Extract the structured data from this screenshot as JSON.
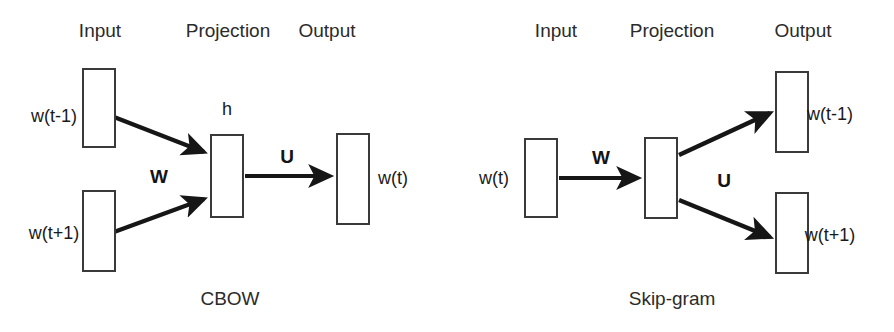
{
  "figure": {
    "width": 894,
    "height": 332,
    "background": "#ffffff",
    "stroke_color": "#222222",
    "box_border_color": "#3a3a3a",
    "text_color": "#1a1a1a"
  },
  "diagrams": [
    {
      "id": "cbow",
      "caption": "CBOW",
      "columns": [
        {
          "label": "Input"
        },
        {
          "label": "Projection"
        },
        {
          "label": "Output"
        }
      ],
      "nodes": [
        {
          "name": "input-box-top",
          "label": "w(t-1)"
        },
        {
          "name": "input-box-bottom",
          "label": "w(t+1)"
        },
        {
          "name": "projection-box",
          "label": "h"
        },
        {
          "name": "output-box",
          "label": "w(t)"
        }
      ],
      "edges": [
        {
          "name": "edge-input-top-to-projection",
          "label": ""
        },
        {
          "name": "edge-input-bottom-to-projection",
          "label": "W"
        },
        {
          "name": "edge-projection-to-output",
          "label": "U"
        }
      ]
    },
    {
      "id": "skip-gram",
      "caption": "Skip-gram",
      "columns": [
        {
          "label": "Input"
        },
        {
          "label": "Projection"
        },
        {
          "label": "Output"
        }
      ],
      "nodes": [
        {
          "name": "input-box",
          "label": "w(t)"
        },
        {
          "name": "projection-box",
          "label": ""
        },
        {
          "name": "output-box-top",
          "label": "w(t-1)"
        },
        {
          "name": "output-box-bottom",
          "label": "w(t+1)"
        }
      ],
      "edges": [
        {
          "name": "edge-input-to-projection",
          "label": "W"
        },
        {
          "name": "edge-projection-to-output-top",
          "label": ""
        },
        {
          "name": "edge-projection-to-output-bottom",
          "label": "U"
        }
      ]
    }
  ]
}
